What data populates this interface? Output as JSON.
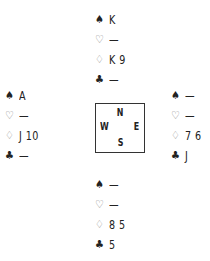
{
  "hands": {
    "north": {
      "spades": "K",
      "hearts": "—",
      "diamonds": "K 9",
      "clubs": "—"
    },
    "west": {
      "spades": "A",
      "hearts": "—",
      "diamonds": "J 10",
      "clubs": "—"
    },
    "east": {
      "spades": "—",
      "hearts": "—",
      "diamonds": "7 6",
      "clubs": "J"
    },
    "south": {
      "spades": "—",
      "hearts": "—",
      "diamonds": "8 5",
      "clubs": "5"
    }
  },
  "suits": {
    "spades": "♠",
    "hearts": "♡",
    "diamonds": "♢",
    "clubs": "♣"
  },
  "compass": {
    "n": "N",
    "s": "S",
    "e": "E",
    "w": "W"
  }
}
